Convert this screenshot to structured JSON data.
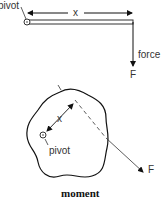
{
  "diagram": {
    "top": {
      "pivot_label": "pivot",
      "distance_label": "x",
      "force_label": "force",
      "force_symbol": "F"
    },
    "bottom": {
      "distance_label": "x",
      "pivot_label": "pivot",
      "force_symbol": "F"
    },
    "caption": "moment"
  }
}
